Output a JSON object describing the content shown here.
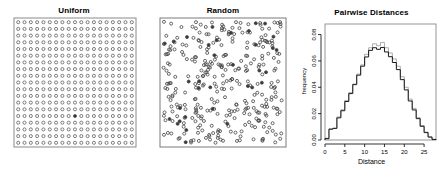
{
  "figure": {
    "background": "#ffffff",
    "panel_count": 3
  },
  "panels": [
    {
      "id": "uniform",
      "title": "Uniform"
    },
    {
      "id": "random",
      "title": "Random"
    },
    {
      "id": "hist",
      "title": "Pairwise Distances"
    }
  ],
  "chart_data": [
    {
      "type": "scatter",
      "title": "Uniform",
      "xlabel": "",
      "ylabel": "",
      "xlim": [
        0,
        20
      ],
      "ylim": [
        0,
        20
      ],
      "grid": false,
      "axes_visible": false,
      "frame": true,
      "point_symbol": "open-circle",
      "point_color": "#555555",
      "n_points": 361,
      "layout": "regular-lattice",
      "lattice_cols": 19,
      "lattice_rows": 19,
      "note": "Points arranged on an evenly spaced 19 by 19 square lattice inside a box frame"
    },
    {
      "type": "scatter",
      "title": "Random",
      "xlabel": "",
      "ylabel": "",
      "xlim": [
        0,
        20
      ],
      "ylim": [
        0,
        20
      ],
      "grid": false,
      "axes_visible": false,
      "frame": true,
      "point_symbol": "open-circle",
      "point_color": "#444444",
      "n_points": 361,
      "layout": "complete-spatial-randomness",
      "note": "Points placed uniformly at random in the unit square, showing clumps and gaps"
    },
    {
      "type": "line",
      "subtype": "histogram-step-outline",
      "title": "Pairwise Distances",
      "xlabel": "Distance",
      "ylabel": "frequency",
      "xlim": [
        0,
        28
      ],
      "ylim": [
        0,
        0.088
      ],
      "xticks": [
        0,
        5,
        10,
        15,
        20,
        25
      ],
      "xticklabels": [
        "0",
        "5",
        "10",
        "15",
        "20",
        "25"
      ],
      "yticks": [
        0.0,
        0.02,
        0.04,
        0.06,
        0.08
      ],
      "yticklabels": [
        "0.00",
        "0.02",
        "0.04",
        "0.06",
        "0.08"
      ],
      "grid": false,
      "legend": false,
      "bin_width": 1,
      "bin_edges": [
        0,
        1,
        2,
        3,
        4,
        5,
        6,
        7,
        8,
        9,
        10,
        11,
        12,
        13,
        14,
        15,
        16,
        17,
        18,
        19,
        20,
        21,
        22,
        23,
        24,
        25,
        26,
        27,
        28
      ],
      "series": [
        {
          "name": "Uniform lattice",
          "color": "#9a9a9a",
          "values": [
            0.0005,
            0.0085,
            0.009,
            0.0175,
            0.023,
            0.03,
            0.036,
            0.0425,
            0.05,
            0.057,
            0.065,
            0.07,
            0.073,
            0.0715,
            0.074,
            0.07,
            0.066,
            0.0615,
            0.056,
            0.048,
            0.04,
            0.031,
            0.024,
            0.017,
            0.011,
            0.006,
            0.0025,
            0.0005
          ]
        },
        {
          "name": "Random points",
          "color": "#1a1a1a",
          "values": [
            0.0012,
            0.0082,
            0.0088,
            0.0168,
            0.0222,
            0.0292,
            0.0352,
            0.042,
            0.0492,
            0.056,
            0.063,
            0.068,
            0.07,
            0.0688,
            0.0702,
            0.0668,
            0.0632,
            0.0588,
            0.0534,
            0.0458,
            0.038,
            0.0296,
            0.0228,
            0.0162,
            0.0104,
            0.0056,
            0.0022,
            0.0004
          ]
        }
      ]
    }
  ]
}
